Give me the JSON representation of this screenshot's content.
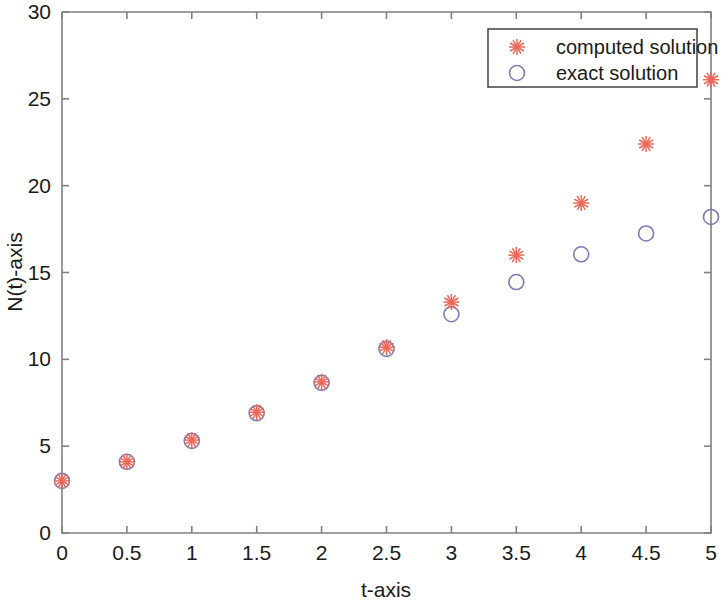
{
  "chart_data": {
    "type": "scatter",
    "title": "",
    "xlabel": "t-axis",
    "ylabel": "N(t)-axis",
    "xlim": [
      0,
      5
    ],
    "ylim": [
      0,
      30
    ],
    "xticks": [
      "0",
      "0.5",
      "1",
      "1.5",
      "2",
      "2.5",
      "3",
      "3.5",
      "4",
      "4.5",
      "5"
    ],
    "xtick_values": [
      0,
      0.5,
      1,
      1.5,
      2,
      2.5,
      3,
      3.5,
      4,
      4.5,
      5
    ],
    "yticks": [
      "0",
      "5",
      "10",
      "15",
      "20",
      "25",
      "30"
    ],
    "ytick_values": [
      0,
      5,
      10,
      15,
      20,
      25,
      30
    ],
    "grid": false,
    "legend_position": "top-right",
    "x": [
      0,
      0.5,
      1,
      1.5,
      2,
      2.5,
      3,
      3.5,
      4,
      4.5,
      5
    ],
    "series": [
      {
        "name": "computed solution",
        "marker": "asterisk",
        "color": "#ee6655",
        "values": [
          3.0,
          4.1,
          5.35,
          6.95,
          8.7,
          10.7,
          13.3,
          16.0,
          19.0,
          22.4,
          26.1
        ]
      },
      {
        "name": "exact solution",
        "marker": "circle",
        "color": "#7b7bb8",
        "values": [
          3.0,
          4.1,
          5.3,
          6.9,
          8.65,
          10.6,
          12.6,
          14.45,
          16.05,
          17.25,
          18.2
        ]
      }
    ]
  },
  "axes": {
    "x_label": "t-axis",
    "y_label": "N(t)-axis",
    "frame_color": "#808080"
  },
  "legend": {
    "entries": [
      {
        "label": "computed solution",
        "marker": "asterisk-marker",
        "color": "#ee6655"
      },
      {
        "label": "exact solution",
        "marker": "circle-marker",
        "color": "#7b7bb8"
      }
    ]
  }
}
